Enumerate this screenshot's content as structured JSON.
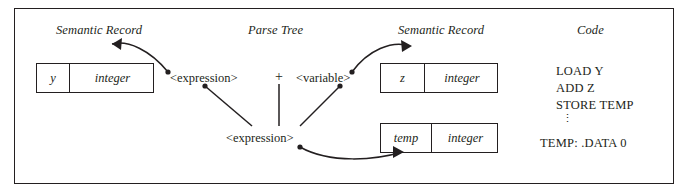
{
  "diagram": {
    "headers": [
      {
        "label": "Semantic Record",
        "x": 56,
        "y": 23
      },
      {
        "label": "Parse Tree",
        "x": 256,
        "y": 23
      },
      {
        "label": "Semantic Record",
        "x": 400,
        "y": 23
      },
      {
        "label": "Code",
        "x": 579,
        "y": 23
      }
    ],
    "records": [
      {
        "name": "record-y-integer",
        "x": 36,
        "y": 63,
        "w": 118,
        "h": 30,
        "split": 32,
        "cells": [
          {
            "label": "y",
            "name": "record-cell-y"
          },
          {
            "label": "integer",
            "name": "record-cell-integer"
          }
        ]
      },
      {
        "name": "record-z-integer",
        "x": 380,
        "y": 63,
        "w": 118,
        "h": 30,
        "split": 43,
        "cells": [
          {
            "label": "z",
            "name": "record-cell-z"
          },
          {
            "label": "integer",
            "name": "record-cell-integer"
          }
        ]
      },
      {
        "name": "record-temp-integer",
        "x": 380,
        "y": 123,
        "w": 118,
        "h": 30,
        "split": 50,
        "cells": [
          {
            "label": "temp",
            "name": "record-cell-temp"
          },
          {
            "label": "integer",
            "name": "record-cell-integer"
          }
        ]
      }
    ],
    "parse_tree": {
      "nodes": [
        {
          "name": "parse-node-expression-left",
          "label": "<expression>",
          "x": 170,
          "y": 71
        },
        {
          "name": "parse-node-operator-plus",
          "label": "+",
          "x": 275,
          "y": 69
        },
        {
          "name": "parse-node-variable",
          "label": "<variable>",
          "x": 298,
          "y": 71
        },
        {
          "name": "parse-node-expression-root",
          "label": "<expression>",
          "x": 228,
          "y": 131
        }
      ]
    },
    "code": {
      "name": "code-listing",
      "lines": [
        {
          "text": "LOAD  Y",
          "x": 556,
          "y": 70
        },
        {
          "text": "ADD   Z",
          "x": 556,
          "y": 87
        },
        {
          "text": "STORE TEMP",
          "x": 556,
          "y": 104
        },
        {
          "text": "⋮",
          "x": 562,
          "y": 118
        },
        {
          "text": "TEMP: .DATA 0",
          "x": 540,
          "y": 143
        }
      ]
    },
    "colors": {
      "ink": "#231f20",
      "background": "#ffffff"
    },
    "connectors": [
      {
        "name": "arrow-expression-left-to-record-y",
        "from": "parse-node-expression-left",
        "to": "record-y-integer"
      },
      {
        "name": "arrow-variable-to-record-z",
        "from": "parse-node-variable",
        "to": "record-z-integer"
      },
      {
        "name": "line-expression-left-to-root",
        "from": "parse-node-expression-left",
        "to": "parse-node-expression-root"
      },
      {
        "name": "line-plus-to-root",
        "from": "parse-node-operator-plus",
        "to": "parse-node-expression-root"
      },
      {
        "name": "line-variable-to-root",
        "from": "parse-node-variable",
        "to": "parse-node-expression-root"
      },
      {
        "name": "arrow-expression-root-to-record-temp",
        "from": "parse-node-expression-root",
        "to": "record-temp-integer"
      }
    ]
  }
}
